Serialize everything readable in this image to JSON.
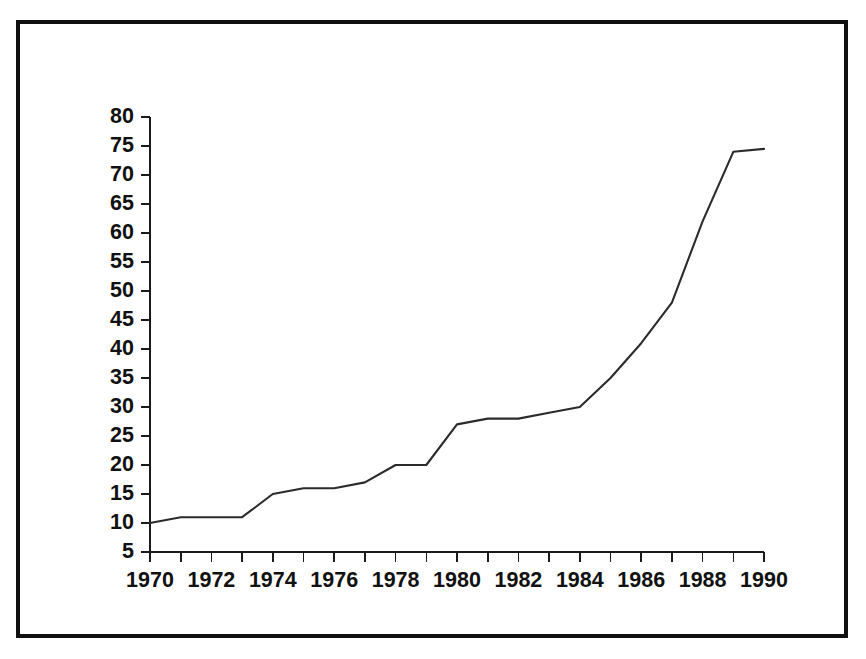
{
  "figure": {
    "background_color": "#ffffff",
    "frame_color": "#111111",
    "axis_color": "#1a1a1a",
    "line_color": "#2b2b2b"
  },
  "chart_data": {
    "type": "line",
    "title": "",
    "subtitle": "",
    "xlabel": "",
    "ylabel": "",
    "grid": false,
    "legend": false,
    "legend_position": "none",
    "xlim": [
      1970,
      1990
    ],
    "ylim": [
      5,
      80
    ],
    "ytick_step": 5,
    "xtick_step": 1,
    "xtick_label_step": 2,
    "x": [
      1970,
      1971,
      1972,
      1973,
      1974,
      1975,
      1976,
      1977,
      1978,
      1979,
      1980,
      1981,
      1982,
      1983,
      1984,
      1985,
      1986,
      1987,
      1988,
      1989,
      1990
    ],
    "yticks": [
      5,
      10,
      15,
      20,
      25,
      30,
      35,
      40,
      45,
      50,
      55,
      60,
      65,
      70,
      75,
      80
    ],
    "ytick_labels": [
      "5",
      "10",
      "15",
      "20",
      "25",
      "30",
      "35",
      "40",
      "45",
      "50",
      "55",
      "60",
      "65",
      "70",
      "75",
      "80"
    ],
    "xticks": [
      1970,
      1971,
      1972,
      1973,
      1974,
      1975,
      1976,
      1977,
      1978,
      1979,
      1980,
      1981,
      1982,
      1983,
      1984,
      1985,
      1986,
      1987,
      1988,
      1989,
      1990
    ],
    "xtick_labels": [
      "1970",
      "",
      "1972",
      "",
      "1974",
      "",
      "1976",
      "",
      "1978",
      "",
      "1980",
      "",
      "1982",
      "",
      "1984",
      "",
      "1986",
      "",
      "1988",
      "",
      "1990"
    ],
    "xtick_labels_shown": [
      "1970",
      "1972",
      "1974",
      "1976",
      "1978",
      "1980",
      "1982",
      "1984",
      "1986",
      "1988",
      "1990"
    ],
    "series": [
      {
        "name": "series-1",
        "values": [
          10,
          11,
          11,
          11,
          15,
          16,
          16,
          17,
          20,
          20,
          27,
          28,
          28,
          29,
          30,
          35,
          41,
          48,
          62,
          74,
          74.5
        ]
      }
    ]
  }
}
